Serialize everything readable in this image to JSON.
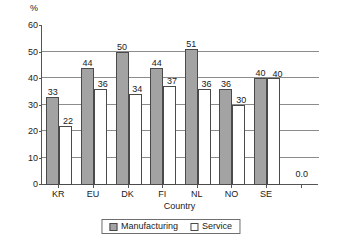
{
  "chart_data": {
    "type": "bar",
    "title": "",
    "unit_label": "%",
    "xlabel": "Country",
    "ylabel": "",
    "ylim": [
      0,
      60
    ],
    "yticks": [
      0,
      10,
      20,
      30,
      40,
      50,
      60
    ],
    "gridlines": [
      10,
      20,
      30,
      40,
      50
    ],
    "grid": true,
    "legend_position": "bottom",
    "categories": [
      "KR",
      "EU",
      "DK",
      "FI",
      "NL",
      "NO",
      "SE"
    ],
    "series": [
      {
        "name": "Manufacturing",
        "color": "#a3a3a3",
        "values": [
          33,
          44,
          50,
          44,
          51,
          36,
          40
        ],
        "labels": [
          "33",
          "44",
          "50",
          "44",
          "51",
          "36",
          "40"
        ]
      },
      {
        "name": "Service",
        "color": "#ffffff",
        "values": [
          22,
          36,
          34,
          37,
          36,
          30,
          40
        ],
        "labels": [
          "22",
          "36",
          "34",
          "37",
          "36",
          "30",
          "40"
        ]
      }
    ],
    "annotations": [
      {
        "text": "0.0",
        "slot": "empty-trailing"
      }
    ]
  },
  "legend": {
    "items": [
      {
        "label": "Manufacturing",
        "swatch": "manufacturing"
      },
      {
        "label": "Service",
        "swatch": "service"
      }
    ]
  }
}
